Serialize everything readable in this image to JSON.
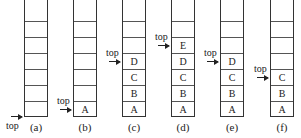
{
  "diagram": {
    "pointer_label": "top",
    "stacks": [
      {
        "caption": "(a)",
        "items": [],
        "top_index": -1
      },
      {
        "caption": "(b)",
        "items": [
          "A"
        ],
        "top_index": 0
      },
      {
        "caption": "(c)",
        "items": [
          "A",
          "B",
          "C",
          "D"
        ],
        "top_index": 3
      },
      {
        "caption": "(d)",
        "items": [
          "A",
          "B",
          "C",
          "D",
          "E"
        ],
        "top_index": 4
      },
      {
        "caption": "(e)",
        "items": [
          "A",
          "B",
          "C",
          "D"
        ],
        "top_index": 3
      },
      {
        "caption": "(f)",
        "items": [
          "A",
          "B",
          "C"
        ],
        "top_index": 2
      }
    ],
    "capacity": 7
  }
}
